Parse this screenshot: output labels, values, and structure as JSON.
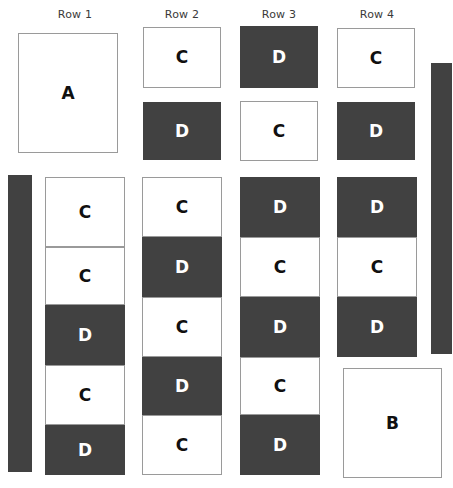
{
  "figure": {
    "background_color": "#ffffff",
    "light_fill": "#ffffff",
    "dark_fill": "#414141",
    "border_color": "#9a9a9a",
    "light_text_color": "#101010",
    "dark_text_color": "#ffffff",
    "header_text_color": "#3a3a3a"
  },
  "headers": [
    {
      "label": "Row 1",
      "cx": 75,
      "cy": 8
    },
    {
      "label": "Row 2",
      "cx": 182,
      "cy": 8
    },
    {
      "label": "Row 3",
      "cx": 279,
      "cy": 8
    },
    {
      "label": "Row 4",
      "cx": 377,
      "cy": 8
    }
  ],
  "big_boxes": [
    {
      "label": "A",
      "x": 18,
      "y": 33,
      "w": 100,
      "h": 120,
      "fill": "light"
    },
    {
      "label": "B",
      "x": 343,
      "y": 368,
      "w": 99,
      "h": 110,
      "fill": "light"
    }
  ],
  "top_cells": [
    {
      "label": "C",
      "fill": "light",
      "x": 143,
      "y": 27,
      "w": 78,
      "h": 61
    },
    {
      "label": "D",
      "fill": "dark",
      "x": 143,
      "y": 102,
      "w": 78,
      "h": 58
    },
    {
      "label": "D",
      "fill": "dark",
      "x": 240,
      "y": 26,
      "w": 78,
      "h": 62
    },
    {
      "label": "C",
      "fill": "light",
      "x": 240,
      "y": 101,
      "w": 78,
      "h": 60
    },
    {
      "label": "C",
      "fill": "light",
      "x": 337,
      "y": 28,
      "w": 78,
      "h": 60
    },
    {
      "label": "D",
      "fill": "dark",
      "x": 337,
      "y": 102,
      "w": 78,
      "h": 58
    }
  ],
  "stacks": [
    {
      "name": "row-1-stack",
      "x": 45,
      "y": 177,
      "w": 80,
      "cells": [
        {
          "label": "C",
          "fill": "light",
          "h": 70
        },
        {
          "label": "C",
          "fill": "light",
          "h": 58
        },
        {
          "label": "D",
          "fill": "dark",
          "h": 60
        },
        {
          "label": "C",
          "fill": "light",
          "h": 60
        },
        {
          "label": "D",
          "fill": "dark",
          "h": 50
        }
      ]
    },
    {
      "name": "row-2-stack",
      "x": 142,
      "y": 177,
      "w": 80,
      "cells": [
        {
          "label": "C",
          "fill": "light",
          "h": 60
        },
        {
          "label": "D",
          "fill": "dark",
          "h": 60
        },
        {
          "label": "C",
          "fill": "light",
          "h": 60
        },
        {
          "label": "D",
          "fill": "dark",
          "h": 58
        },
        {
          "label": "C",
          "fill": "light",
          "h": 60
        }
      ]
    },
    {
      "name": "row-3-stack",
      "x": 240,
      "y": 177,
      "w": 80,
      "cells": [
        {
          "label": "D",
          "fill": "dark",
          "h": 60
        },
        {
          "label": "C",
          "fill": "light",
          "h": 60
        },
        {
          "label": "D",
          "fill": "dark",
          "h": 60
        },
        {
          "label": "C",
          "fill": "light",
          "h": 58
        },
        {
          "label": "D",
          "fill": "dark",
          "h": 60
        }
      ]
    },
    {
      "name": "row-4-stack",
      "x": 337,
      "y": 177,
      "w": 80,
      "cells": [
        {
          "label": "D",
          "fill": "dark",
          "h": 60
        },
        {
          "label": "C",
          "fill": "light",
          "h": 60
        },
        {
          "label": "D",
          "fill": "dark",
          "h": 60
        }
      ]
    }
  ],
  "bars": [
    {
      "name": "left-bar",
      "x": 8,
      "y": 175,
      "w": 24,
      "h": 297
    },
    {
      "name": "right-bar",
      "x": 431,
      "y": 63,
      "w": 21,
      "h": 291
    }
  ]
}
